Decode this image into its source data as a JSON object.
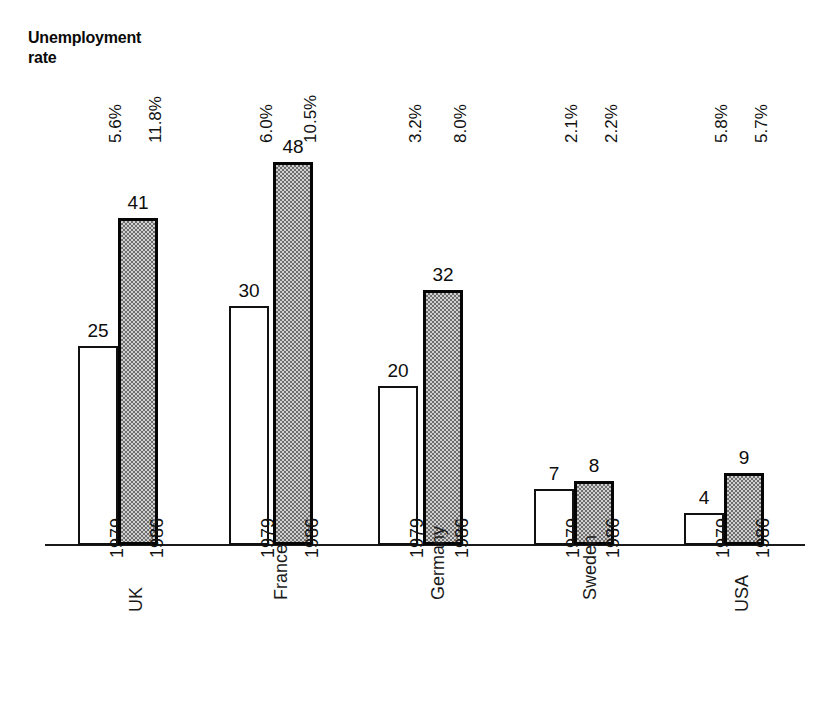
{
  "title": "Unemployment\nrate",
  "chart_data": {
    "type": "bar",
    "title": "Unemployment rate",
    "subtitle": "",
    "xlabel": "",
    "ylabel": "",
    "ylim": [
      0,
      50
    ],
    "grid": false,
    "legend": "none",
    "categories": [
      "UK",
      "France",
      "Germany",
      "Sweden",
      "USA"
    ],
    "series": [
      {
        "name": "1979",
        "values": [
          25,
          30,
          20,
          7,
          4
        ],
        "style": "white-outline"
      },
      {
        "name": "1986",
        "values": [
          41,
          48,
          32,
          8,
          9
        ],
        "style": "gray-hatched"
      }
    ],
    "annotations": {
      "unemployment_rate": {
        "1979": [
          "5.6%",
          "6.0%",
          "3.2%",
          "2.1%",
          "5.8%"
        ],
        "1986": [
          "11.8%",
          "10.5%",
          "8.0%",
          "2.2%",
          "5.7%"
        ]
      }
    }
  },
  "groups": [
    {
      "country": "UK",
      "bars": [
        {
          "year": "1979",
          "value": "25",
          "pct": "5.6%"
        },
        {
          "year": "1986",
          "value": "41",
          "pct": "11.8%"
        }
      ]
    },
    {
      "country": "France",
      "bars": [
        {
          "year": "1979",
          "value": "30",
          "pct": "6.0%"
        },
        {
          "year": "1986",
          "value": "48",
          "pct": "10.5%"
        }
      ]
    },
    {
      "country": "Germany",
      "bars": [
        {
          "year": "1979",
          "value": "20",
          "pct": "3.2%"
        },
        {
          "year": "1986",
          "value": "32",
          "pct": "8.0%"
        }
      ]
    },
    {
      "country": "Sweden",
      "bars": [
        {
          "year": "1979",
          "value": "7",
          "pct": "2.1%"
        },
        {
          "year": "1986",
          "value": "8",
          "pct": "2.2%"
        }
      ]
    },
    {
      "country": "USA",
      "bars": [
        {
          "year": "1979",
          "value": "4",
          "pct": "5.8%"
        },
        {
          "year": "1986",
          "value": "9",
          "pct": "5.7%"
        }
      ]
    }
  ],
  "colors": {
    "ink": "#111111",
    "bar_1979_fill": "#ffffff",
    "bar_1986_fill": "#bfbfbf",
    "axis": "#1a1a1a"
  }
}
